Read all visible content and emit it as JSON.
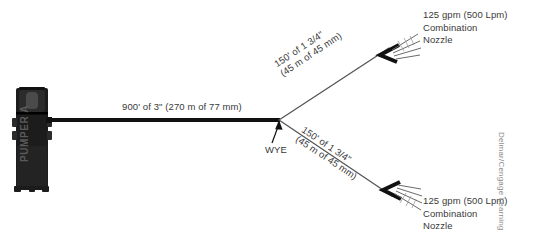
{
  "diagram": {
    "background_color": "#ffffff",
    "line_color": "#111111",
    "text_color": "#3a3a3a"
  },
  "apparatus": {
    "name": "PUMPER A",
    "body_color": "#1c1c1c"
  },
  "supply_line": {
    "label": "900' of 3\" (270 m of 77 mm)",
    "length_ft": 900,
    "diameter_in": "3\"",
    "length_m": 270,
    "diameter_mm": 77
  },
  "wye": {
    "label": "WYE"
  },
  "branches": [
    {
      "id": "upper",
      "label_line1": "150' of 1 3/4\"",
      "label_line2": "(45 m of 45 mm)",
      "length_ft": 150,
      "diameter_in": "1 3/4\"",
      "length_m": 45,
      "diameter_mm": 45
    },
    {
      "id": "lower",
      "label_line1": "150' of 1 3/4\"",
      "label_line2": "(45 m of 45 mm)",
      "length_ft": 150,
      "diameter_in": "1 3/4\"",
      "length_m": 45,
      "diameter_mm": 45
    }
  ],
  "nozzles": [
    {
      "id": "upper",
      "flow_line": "125 gpm (500 Lpm)",
      "type_line1": "Combination",
      "type_line2": "Nozzle",
      "flow_gpm": 125,
      "flow_lpm": 500
    },
    {
      "id": "lower",
      "flow_line": "125 gpm (500 Lpm)",
      "type_line1": "Combination",
      "type_line2": "Nozzle",
      "flow_gpm": 125,
      "flow_lpm": 500
    }
  ],
  "attribution": {
    "text": "Delmar/Cengage Learning"
  }
}
